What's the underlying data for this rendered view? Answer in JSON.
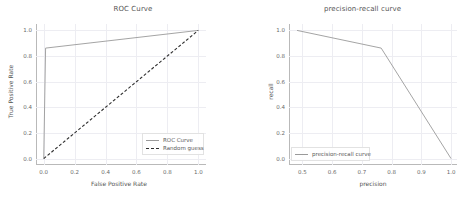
{
  "figure": {
    "background_color": "#ffffff",
    "line_color_solid": "#9a9a9a",
    "line_color_dashed": "#2f2f2f",
    "grid_color": "#ededf2"
  },
  "chart_data": [
    {
      "type": "line",
      "title": "ROC Curve",
      "xlabel": "False Positive Rate",
      "ylabel": "True Positive Rate",
      "xlim": [
        -0.05,
        1.05
      ],
      "ylim": [
        -0.05,
        1.05
      ],
      "xticks": [
        "0.0",
        "0.2",
        "0.4",
        "0.6",
        "0.8",
        "1.0"
      ],
      "xtick_values": [
        0.0,
        0.2,
        0.4,
        0.6,
        0.8,
        1.0
      ],
      "yticks": [
        "0.0",
        "0.2",
        "0.4",
        "0.6",
        "0.8",
        "1.0"
      ],
      "ytick_values": [
        0.0,
        0.2,
        0.4,
        0.6,
        0.8,
        1.0
      ],
      "grid": true,
      "legend_position": "lower right",
      "series": [
        {
          "name": "ROC Curve",
          "style": "solid",
          "color": "#9a9a9a",
          "x": [
            0.0,
            0.012,
            1.0
          ],
          "y": [
            0.0,
            0.862,
            1.0
          ]
        },
        {
          "name": "Random guess",
          "style": "dashed",
          "color": "#2f2f2f",
          "x": [
            0.0,
            1.0
          ],
          "y": [
            0.0,
            1.0
          ]
        }
      ]
    },
    {
      "type": "line",
      "title": "precision-recall curve",
      "xlabel": "precision",
      "ylabel": "recall",
      "xlim": [
        0.455,
        1.02
      ],
      "ylim": [
        -0.05,
        1.05
      ],
      "xticks": [
        "0.5",
        "0.6",
        "0.7",
        "0.8",
        "0.9",
        "1.0"
      ],
      "xtick_values": [
        0.5,
        0.6,
        0.7,
        0.8,
        0.9,
        1.0
      ],
      "yticks": [
        "0.0",
        "0.2",
        "0.4",
        "0.6",
        "0.8",
        "1.0"
      ],
      "ytick_values": [
        0.0,
        0.2,
        0.4,
        0.6,
        0.8,
        1.0
      ],
      "grid": true,
      "legend_position": "lower left",
      "series": [
        {
          "name": "precision-recall curve",
          "style": "solid",
          "color": "#9a9a9a",
          "x": [
            0.482,
            0.765,
            1.0
          ],
          "y": [
            1.0,
            0.862,
            0.0
          ]
        }
      ]
    }
  ]
}
